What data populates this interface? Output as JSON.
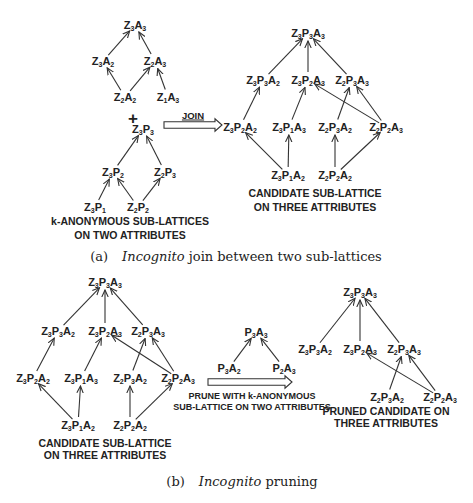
{
  "panel_a": {
    "lattice_za": {
      "nodes": [
        {
          "id": "Z3A3",
          "z": "3",
          "a": "3",
          "x": 135,
          "y": 25
        },
        {
          "id": "Z3A2",
          "z": "3",
          "a": "2",
          "x": 103,
          "y": 61
        },
        {
          "id": "Z2A3",
          "z": "2",
          "a": "3",
          "x": 155,
          "y": 61
        },
        {
          "id": "Z2A2",
          "z": "2",
          "a": "2",
          "x": 125,
          "y": 97
        },
        {
          "id": "Z1A3",
          "z": "1",
          "a": "3",
          "x": 168,
          "y": 97
        }
      ],
      "edges": [
        [
          "Z3A2",
          "Z3A3"
        ],
        [
          "Z2A3",
          "Z3A3"
        ],
        [
          "Z2A2",
          "Z3A2"
        ],
        [
          "Z2A2",
          "Z2A3"
        ],
        [
          "Z1A3",
          "Z2A3"
        ]
      ]
    },
    "plus": "+",
    "lattice_zp": {
      "nodes": [
        {
          "id": "Z3P3",
          "z": "3",
          "p": "3",
          "x": 143,
          "y": 129
        },
        {
          "id": "Z3P2",
          "z": "3",
          "p": "2",
          "x": 113,
          "y": 172
        },
        {
          "id": "Z2P3",
          "z": "2",
          "p": "3",
          "x": 165,
          "y": 172
        },
        {
          "id": "Z3P1",
          "z": "3",
          "p": "1",
          "x": 95,
          "y": 207
        },
        {
          "id": "Z2P2",
          "z": "2",
          "p": "2",
          "x": 138,
          "y": 207
        }
      ],
      "edges": [
        [
          "Z3P2",
          "Z3P3"
        ],
        [
          "Z2P3",
          "Z3P3"
        ],
        [
          "Z3P1",
          "Z3P2"
        ],
        [
          "Z2P2",
          "Z3P2"
        ],
        [
          "Z2P2",
          "Z2P3"
        ]
      ]
    },
    "left_label": [
      "k-ANONYMOUS SUB-LATTICES",
      "ON TWO ATTRIBUTES"
    ],
    "join_arrow": {
      "label": "JOIN",
      "x1": 164,
      "x2": 222,
      "y": 125
    },
    "candidate": {
      "nodes": [
        {
          "id": "Z3P3A3",
          "z": "3",
          "p": "3",
          "a": "3",
          "x": 308,
          "y": 33
        },
        {
          "id": "Z3P3A2",
          "z": "3",
          "p": "3",
          "a": "2",
          "x": 263,
          "y": 80
        },
        {
          "id": "Z3P2A3",
          "z": "3",
          "p": "2",
          "a": "3",
          "x": 308,
          "y": 80
        },
        {
          "id": "Z2P3A3",
          "z": "2",
          "p": "3",
          "a": "3",
          "x": 352,
          "y": 80
        },
        {
          "id": "Z3P2A2",
          "z": "3",
          "p": "2",
          "a": "2",
          "x": 240,
          "y": 127
        },
        {
          "id": "Z3P1A3",
          "z": "3",
          "p": "1",
          "a": "3",
          "x": 289,
          "y": 127
        },
        {
          "id": "Z2P3A2",
          "z": "2",
          "p": "3",
          "a": "2",
          "x": 335,
          "y": 127
        },
        {
          "id": "Z2P2A3",
          "z": "2",
          "p": "2",
          "a": "3",
          "x": 386,
          "y": 127
        },
        {
          "id": "Z3P1A2",
          "z": "3",
          "p": "1",
          "a": "2",
          "x": 288,
          "y": 175
        },
        {
          "id": "Z2P2A2",
          "z": "2",
          "p": "2",
          "a": "2",
          "x": 335,
          "y": 175
        }
      ],
      "edges": [
        [
          "Z3P3A2",
          "Z3P3A3"
        ],
        [
          "Z3P2A3",
          "Z3P3A3"
        ],
        [
          "Z2P3A3",
          "Z3P3A3"
        ],
        [
          "Z3P2A2",
          "Z3P3A2"
        ],
        [
          "Z3P1A3",
          "Z3P2A3"
        ],
        [
          "Z2P3A2",
          "Z2P3A3"
        ],
        [
          "Z2P2A3",
          "Z3P2A3"
        ],
        [
          "Z2P2A3",
          "Z2P3A3"
        ],
        [
          "Z3P1A2",
          "Z3P2A2"
        ],
        [
          "Z3P1A2",
          "Z3P1A3"
        ],
        [
          "Z2P2A2",
          "Z2P3A2"
        ],
        [
          "Z2P2A2",
          "Z2P2A3"
        ]
      ]
    },
    "candidate_label": [
      "CANDIDATE SUB-LATTICE",
      "ON THREE ATTRIBUTES"
    ],
    "caption": {
      "tag": "(a)",
      "italic": "Incognito",
      "rest": " join between two sub-lattices"
    }
  },
  "panel_b": {
    "candidate": {
      "nodes": [
        {
          "id": "Z3P3A3",
          "z": "3",
          "p": "3",
          "a": "3",
          "x": 105,
          "y": 282
        },
        {
          "id": "Z3P3A2",
          "z": "3",
          "p": "3",
          "a": "2",
          "x": 58,
          "y": 331
        },
        {
          "id": "Z3P2A3",
          "z": "3",
          "p": "2",
          "a": "3",
          "x": 105,
          "y": 331
        },
        {
          "id": "Z2P3A3",
          "z": "2",
          "p": "3",
          "a": "3",
          "x": 148,
          "y": 331
        },
        {
          "id": "Z3P2A2",
          "z": "3",
          "p": "2",
          "a": "2",
          "x": 33,
          "y": 378
        },
        {
          "id": "Z3P1A3",
          "z": "3",
          "p": "1",
          "a": "3",
          "x": 81,
          "y": 378
        },
        {
          "id": "Z2P3A2",
          "z": "2",
          "p": "3",
          "a": "2",
          "x": 130,
          "y": 378
        },
        {
          "id": "Z2P2A3",
          "z": "2",
          "p": "2",
          "a": "3",
          "x": 178,
          "y": 378
        },
        {
          "id": "Z3P1A2",
          "z": "3",
          "p": "1",
          "a": "2",
          "x": 78,
          "y": 425
        },
        {
          "id": "Z2P2A2",
          "z": "2",
          "p": "2",
          "a": "2",
          "x": 130,
          "y": 425
        }
      ],
      "edges": [
        [
          "Z3P3A2",
          "Z3P3A3"
        ],
        [
          "Z3P2A3",
          "Z3P3A3"
        ],
        [
          "Z2P3A3",
          "Z3P3A3"
        ],
        [
          "Z3P2A2",
          "Z3P3A2"
        ],
        [
          "Z3P1A3",
          "Z3P2A3"
        ],
        [
          "Z2P3A2",
          "Z2P3A3"
        ],
        [
          "Z2P2A3",
          "Z3P2A3"
        ],
        [
          "Z2P2A3",
          "Z2P3A3"
        ],
        [
          "Z3P1A2",
          "Z3P2A2"
        ],
        [
          "Z3P1A2",
          "Z3P1A3"
        ],
        [
          "Z2P2A2",
          "Z2P3A2"
        ],
        [
          "Z2P2A2",
          "Z2P2A3"
        ]
      ]
    },
    "candidate_label": [
      "CANDIDATE SUB-LATTICE",
      "ON THREE ATTRIBUTES"
    ],
    "pa_lattice": {
      "nodes": [
        {
          "id": "P3A3",
          "p": "3",
          "a": "3",
          "x": 256,
          "y": 332
        },
        {
          "id": "P3A2",
          "p": "3",
          "a": "2",
          "x": 229,
          "y": 368
        },
        {
          "id": "P2A3",
          "p": "2",
          "a": "3",
          "x": 284,
          "y": 368
        }
      ],
      "edges": [
        [
          "P3A2",
          "P3A3"
        ],
        [
          "P2A3",
          "P3A3"
        ]
      ]
    },
    "prune_arrow": {
      "x1": 208,
      "x2": 292,
      "y": 382
    },
    "prune_label": [
      "PRUNE WITH k-ANONYMOUS",
      "SUB-LATTICE ON TWO ATTRIBUTES"
    ],
    "pruned": {
      "nodes": [
        {
          "id": "Z3P3A3",
          "z": "3",
          "p": "3",
          "a": "3",
          "x": 360,
          "y": 292
        },
        {
          "id": "Z3P3A2",
          "z": "3",
          "p": "3",
          "a": "2",
          "x": 315,
          "y": 349
        },
        {
          "id": "Z3P2A3",
          "z": "3",
          "p": "2",
          "a": "3",
          "x": 360,
          "y": 349
        },
        {
          "id": "Z2P3A3",
          "z": "2",
          "p": "3",
          "a": "3",
          "x": 404,
          "y": 349
        },
        {
          "id": "Z2P3A2",
          "z": "2",
          "p": "3",
          "a": "2",
          "x": 387,
          "y": 397
        },
        {
          "id": "Z2P2A3",
          "z": "2",
          "p": "2",
          "a": "3",
          "x": 440,
          "y": 397
        }
      ],
      "edges": [
        [
          "Z3P3A2",
          "Z3P3A3"
        ],
        [
          "Z3P2A3",
          "Z3P3A3"
        ],
        [
          "Z2P3A3",
          "Z3P3A3"
        ],
        [
          "Z2P3A2",
          "Z2P3A3"
        ],
        [
          "Z2P2A3",
          "Z3P2A3"
        ],
        [
          "Z2P2A3",
          "Z2P3A3"
        ]
      ]
    },
    "pruned_label": [
      "PRUNED CANDIDATE ON",
      "THREE ATTRIBUTES"
    ],
    "caption": {
      "tag": "(b)",
      "italic": "Incognito",
      "rest": " pruning"
    }
  }
}
